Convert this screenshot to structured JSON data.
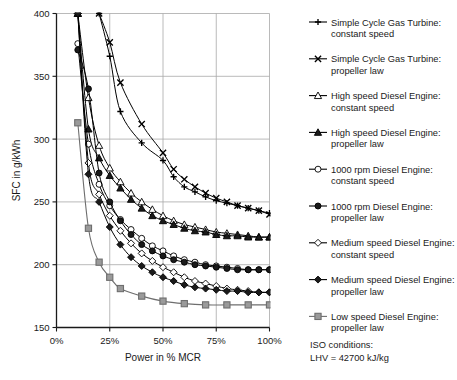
{
  "chart_data": {
    "type": "line",
    "title": "",
    "xlabel": "Power in % MCR",
    "ylabel": "SFC in g/kWh",
    "xlim": [
      0,
      100
    ],
    "ylim": [
      150,
      400
    ],
    "xticks": [
      0,
      25,
      50,
      75,
      100
    ],
    "xtick_labels": [
      "0%",
      "25%",
      "50%",
      "75%",
      "100%"
    ],
    "yticks": [
      150,
      200,
      250,
      300,
      350,
      400
    ],
    "ytick_labels": [
      "150",
      "200",
      "250",
      "300",
      "350",
      "400"
    ],
    "grid": true,
    "legend_position": "right",
    "annotations": [
      "ISO conditions:",
      "LHV = 42700 kJ/kg"
    ],
    "series": [
      {
        "name": "Simple Cycle Gas Turbine: constant speed",
        "marker": "plus",
        "fill": "none",
        "stroke": "#000000",
        "x": [
          20,
          25,
          30,
          40,
          50,
          55,
          60,
          65,
          70,
          75,
          80,
          85,
          90,
          95,
          100
        ],
        "y": [
          400,
          366,
          322,
          297,
          283,
          270,
          262,
          258,
          254,
          251,
          249,
          247,
          245,
          243,
          241
        ]
      },
      {
        "name": "Simple Cycle Gas Turbine: propeller law",
        "marker": "cross",
        "fill": "none",
        "stroke": "#000000",
        "x": [
          20,
          25,
          30,
          40,
          50,
          55,
          60,
          65,
          70,
          75,
          80,
          85,
          90,
          95,
          100
        ],
        "y": [
          400,
          377,
          345,
          312,
          289,
          276,
          268,
          262,
          257,
          253,
          250,
          247,
          245,
          243,
          240
        ]
      },
      {
        "name": "High speed Diesel Engine: constant speed",
        "marker": "triangle-open",
        "fill": "#ffffff",
        "stroke": "#000000",
        "x": [
          10,
          15,
          20,
          25,
          30,
          35,
          40,
          45,
          50,
          55,
          60,
          65,
          70,
          75,
          80,
          85,
          90,
          95,
          100
        ],
        "y": [
          400,
          333,
          295,
          277,
          266,
          257,
          250,
          244,
          239,
          235,
          232,
          230,
          228,
          226,
          225,
          224,
          223,
          222,
          222
        ]
      },
      {
        "name": "High speed Diesel Engine: propeller law",
        "marker": "triangle-filled",
        "fill": "#1a1a1a",
        "stroke": "#000000",
        "x": [
          10,
          15,
          20,
          25,
          30,
          35,
          40,
          45,
          50,
          55,
          60,
          65,
          70,
          75,
          80,
          85,
          90,
          95,
          100
        ],
        "y": [
          400,
          308,
          285,
          271,
          261,
          252,
          245,
          239,
          235,
          232,
          229,
          227,
          226,
          224,
          223,
          223,
          222,
          222,
          222
        ]
      },
      {
        "name": "1000 rpm Diesel Engine: constant speed",
        "marker": "circle-open",
        "fill": "#ffffff",
        "stroke": "#000000",
        "x": [
          10,
          15,
          20,
          25,
          30,
          35,
          40,
          45,
          50,
          55,
          60,
          65,
          70,
          75,
          80,
          85,
          90,
          95,
          100
        ],
        "y": [
          376,
          296,
          264,
          247,
          236,
          228,
          221,
          215,
          211,
          207,
          204,
          202,
          200,
          199,
          198,
          197,
          196,
          196,
          196
        ]
      },
      {
        "name": "1000 rpm Diesel Engine: propeller law",
        "marker": "circle-filled",
        "fill": "#1a1a1a",
        "stroke": "#000000",
        "x": [
          10,
          15,
          20,
          25,
          30,
          35,
          40,
          45,
          50,
          55,
          60,
          65,
          70,
          75,
          80,
          85,
          90,
          95,
          100
        ],
        "y": [
          371,
          340,
          273,
          250,
          235,
          224,
          216,
          211,
          207,
          204,
          202,
          200,
          199,
          198,
          197,
          196,
          196,
          196,
          196
        ]
      },
      {
        "name": "Medium speed Diesel Engine: constant speed",
        "marker": "diamond-open",
        "fill": "#ffffff",
        "stroke": "#000000",
        "x": [
          10,
          15,
          20,
          25,
          30,
          35,
          40,
          45,
          50,
          55,
          60,
          65,
          70,
          75,
          80,
          85,
          90,
          95,
          100
        ],
        "y": [
          400,
          281,
          256,
          239,
          227,
          217,
          209,
          203,
          198,
          194,
          190,
          187,
          185,
          183,
          181,
          180,
          179,
          178,
          178
        ]
      },
      {
        "name": "Medium speed Diesel Engine: propeller law",
        "marker": "diamond-filled",
        "fill": "#1a1a1a",
        "stroke": "#000000",
        "x": [
          10,
          15,
          20,
          25,
          30,
          35,
          40,
          45,
          50,
          55,
          60,
          65,
          70,
          75,
          80,
          85,
          90,
          95,
          100
        ],
        "y": [
          400,
          272,
          250,
          230,
          216,
          206,
          199,
          194,
          190,
          187,
          184,
          182,
          181,
          180,
          179,
          179,
          178,
          178,
          178
        ]
      },
      {
        "name": "Low speed Diesel Engine: propeller law",
        "marker": "square",
        "fill": "#9a9a9a",
        "stroke": "#6e6e6e",
        "x": [
          10,
          15,
          20,
          25,
          30,
          40,
          50,
          60,
          70,
          80,
          90,
          100
        ],
        "y": [
          313,
          229,
          202,
          190,
          181,
          175,
          171,
          169,
          168,
          168,
          168,
          168
        ]
      }
    ]
  },
  "axes": {
    "ylabel": "SFC in g/kWh",
    "xlabel": "Power in % MCR"
  },
  "legend": {
    "items": [
      {
        "line1": "Simple Cycle Gas Turbine:",
        "line2": "constant speed",
        "marker": "plus"
      },
      {
        "line1": "Simple Cycle Gas Turbine:",
        "line2": "propeller law",
        "marker": "cross"
      },
      {
        "line1": "High speed Diesel Engine:",
        "line2": "constant speed",
        "marker": "triangle-open"
      },
      {
        "line1": "High speed Diesel Engine:",
        "line2": "propeller law",
        "marker": "triangle-filled"
      },
      {
        "line1": "1000 rpm Diesel Engine:",
        "line2": "constant speed",
        "marker": "circle-open"
      },
      {
        "line1": "1000 rpm Diesel Engine:",
        "line2": "propeller law",
        "marker": "circle-filled"
      },
      {
        "line1": "Medium speed Diesel Engine:",
        "line2": "constant speed",
        "marker": "diamond-open"
      },
      {
        "line1": "Medium speed Diesel Engine:",
        "line2": "propeller law",
        "marker": "diamond-filled"
      },
      {
        "line1": "Low speed Diesel Engine:",
        "line2": "propeller law",
        "marker": "square"
      }
    ]
  },
  "notes": {
    "line1": "ISO conditions:",
    "line2": "LHV = 42700 kJ/kg"
  },
  "colors": {
    "axis": "#1a1a1a",
    "grid": "#a8a8a8",
    "line": "#000000",
    "square_fill": "#9a9a9a",
    "square_stroke": "#6e6e6e",
    "background": "#ffffff"
  }
}
